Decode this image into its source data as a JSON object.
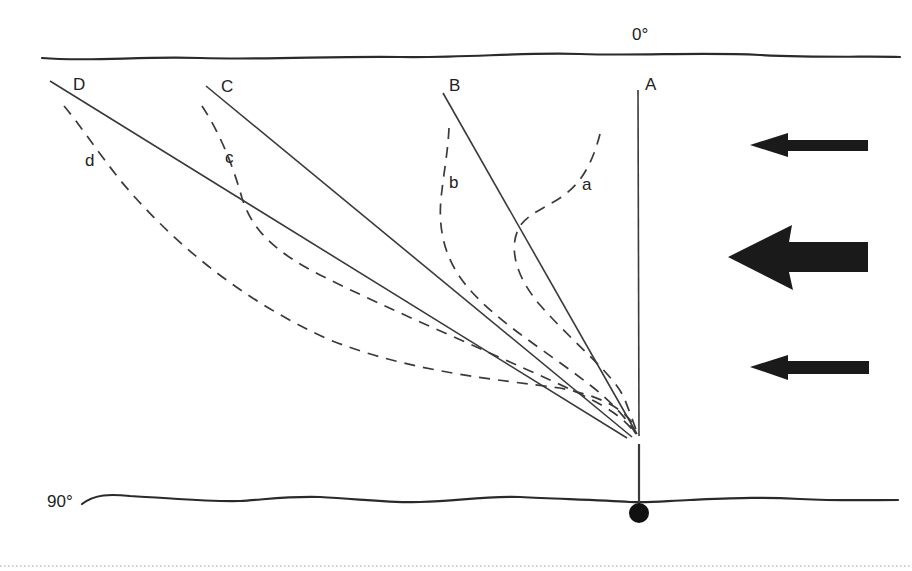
{
  "figure": {
    "top_angle_label": "0°",
    "bottom_angle_label": "90°",
    "straight_lines": [
      {
        "label": "A"
      },
      {
        "label": "B"
      },
      {
        "label": "C"
      },
      {
        "label": "D"
      }
    ],
    "curved_lines": [
      {
        "label": "a"
      },
      {
        "label": "b"
      },
      {
        "label": "c"
      },
      {
        "label": "d"
      }
    ],
    "flow_arrows": [
      {
        "name": "top-arrow",
        "size": "small",
        "direction": "left"
      },
      {
        "name": "middle-arrow",
        "size": "large",
        "direction": "left"
      },
      {
        "name": "bottom-arrow",
        "size": "small",
        "direction": "left"
      }
    ],
    "colors": {
      "line": "#3a3a3a",
      "arrow": "#1a1a1a",
      "background": "#ffffff"
    }
  }
}
